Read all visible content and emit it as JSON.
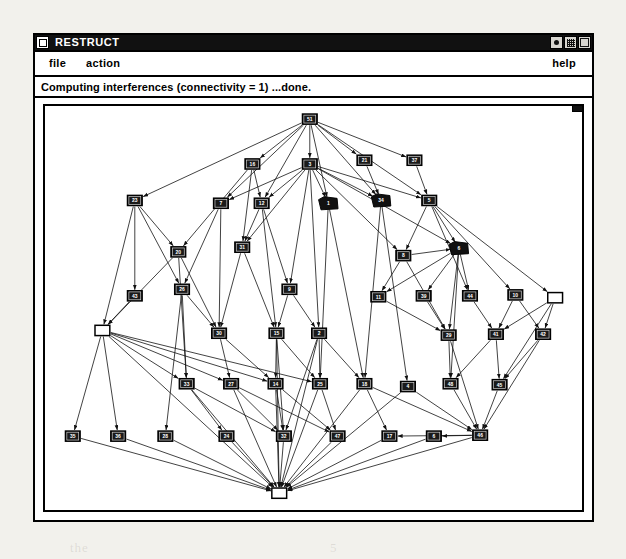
{
  "window": {
    "title": "RESTRUCT",
    "menu_button_icon": "window-menu-icon",
    "controls": [
      {
        "name": "minimize-button",
        "icon": "dot-icon"
      },
      {
        "name": "maximize-button",
        "icon": "grid-icon"
      },
      {
        "name": "close-button",
        "icon": "square-icon"
      }
    ]
  },
  "menu_bar": {
    "items": [
      {
        "label": "file",
        "name": "menu-item-file"
      },
      {
        "label": "action",
        "name": "menu-item-action"
      }
    ],
    "help_label": "help"
  },
  "status_bar": {
    "text": "Computing interferences (connectivity = 1) ...done."
  },
  "graph": {
    "type": "directed-acyclic-graph",
    "node_count": 52,
    "colors": {
      "node_fill_default": "#111111",
      "node_fill_highlight": "#ffffff",
      "node_stroke": "#000000",
      "edge": "#111111",
      "canvas": "#ffffff"
    },
    "legend": {
      "filled_black_box": "standard node",
      "solid_black_blob": "collapsed / selected node",
      "hollow_white_box": "root or sink node"
    },
    "nodes": [
      {
        "id": "51",
        "label": "51",
        "x": 286,
        "y": 14,
        "style": "box"
      },
      {
        "id": "16",
        "label": "16",
        "x": 224,
        "y": 62,
        "style": "box"
      },
      {
        "id": "3",
        "label": "3",
        "x": 286,
        "y": 62,
        "style": "box"
      },
      {
        "id": "21",
        "label": "21",
        "x": 345,
        "y": 58,
        "style": "box"
      },
      {
        "id": "37",
        "label": "37",
        "x": 399,
        "y": 58,
        "style": "box"
      },
      {
        "id": "23",
        "label": "23",
        "x": 97,
        "y": 101,
        "style": "box"
      },
      {
        "id": "7",
        "label": "7",
        "x": 190,
        "y": 104,
        "style": "box"
      },
      {
        "id": "12",
        "label": "12",
        "x": 234,
        "y": 104,
        "style": "box"
      },
      {
        "id": "1",
        "label": "1",
        "x": 306,
        "y": 104,
        "style": "blob"
      },
      {
        "id": "34",
        "label": "34",
        "x": 363,
        "y": 101,
        "style": "blob"
      },
      {
        "id": "5",
        "label": "5",
        "x": 415,
        "y": 101,
        "style": "box"
      },
      {
        "id": "20",
        "label": "20",
        "x": 144,
        "y": 156,
        "style": "box"
      },
      {
        "id": "31",
        "label": "31",
        "x": 213,
        "y": 151,
        "style": "box"
      },
      {
        "id": "6",
        "label": "6",
        "x": 447,
        "y": 152,
        "style": "blob"
      },
      {
        "id": "8",
        "label": "8",
        "x": 387,
        "y": 160,
        "style": "box"
      },
      {
        "id": "43",
        "label": "43",
        "x": 97,
        "y": 203,
        "style": "box"
      },
      {
        "id": "26",
        "label": "26",
        "x": 148,
        "y": 196,
        "style": "box"
      },
      {
        "id": "9",
        "label": "9",
        "x": 264,
        "y": 196,
        "style": "box"
      },
      {
        "id": "11",
        "label": "11",
        "x": 360,
        "y": 204,
        "style": "box"
      },
      {
        "id": "39",
        "label": "39",
        "x": 409,
        "y": 203,
        "style": "box"
      },
      {
        "id": "44",
        "label": "44",
        "x": 459,
        "y": 203,
        "style": "box"
      },
      {
        "id": "10",
        "label": "10",
        "x": 508,
        "y": 202,
        "style": "box"
      },
      {
        "id": "R1",
        "label": "",
        "x": 551,
        "y": 205,
        "style": "hollow"
      },
      {
        "id": "L1",
        "label": "",
        "x": 62,
        "y": 240,
        "style": "hollow"
      },
      {
        "id": "30",
        "label": "30",
        "x": 188,
        "y": 243,
        "style": "box"
      },
      {
        "id": "15",
        "label": "15",
        "x": 250,
        "y": 243,
        "style": "box"
      },
      {
        "id": "2",
        "label": "2",
        "x": 296,
        "y": 243,
        "style": "box"
      },
      {
        "id": "29",
        "label": "29",
        "x": 436,
        "y": 245,
        "style": "box"
      },
      {
        "id": "41",
        "label": "41",
        "x": 487,
        "y": 244,
        "style": "box"
      },
      {
        "id": "42",
        "label": "42",
        "x": 538,
        "y": 244,
        "style": "box"
      },
      {
        "id": "33",
        "label": "33",
        "x": 153,
        "y": 297,
        "style": "box"
      },
      {
        "id": "27",
        "label": "27",
        "x": 201,
        "y": 297,
        "style": "box"
      },
      {
        "id": "14",
        "label": "14",
        "x": 249,
        "y": 297,
        "style": "box"
      },
      {
        "id": "25",
        "label": "25",
        "x": 297,
        "y": 297,
        "style": "box"
      },
      {
        "id": "18",
        "label": "18",
        "x": 345,
        "y": 297,
        "style": "box"
      },
      {
        "id": "4",
        "label": "4",
        "x": 392,
        "y": 300,
        "style": "box"
      },
      {
        "id": "48",
        "label": "48",
        "x": 438,
        "y": 297,
        "style": "box"
      },
      {
        "id": "45",
        "label": "45",
        "x": 491,
        "y": 298,
        "style": "box"
      },
      {
        "id": "35",
        "label": "35",
        "x": 30,
        "y": 353,
        "style": "box"
      },
      {
        "id": "36",
        "label": "36",
        "x": 79,
        "y": 353,
        "style": "box"
      },
      {
        "id": "28",
        "label": "28",
        "x": 130,
        "y": 353,
        "style": "box"
      },
      {
        "id": "24",
        "label": "24",
        "x": 196,
        "y": 353,
        "style": "box"
      },
      {
        "id": "32",
        "label": "32",
        "x": 258,
        "y": 353,
        "style": "box"
      },
      {
        "id": "47",
        "label": "47",
        "x": 316,
        "y": 353,
        "style": "box"
      },
      {
        "id": "17",
        "label": "17",
        "x": 372,
        "y": 353,
        "style": "box"
      },
      {
        "id": "6b",
        "label": "6",
        "x": 420,
        "y": 353,
        "style": "box"
      },
      {
        "id": "46",
        "label": "46",
        "x": 470,
        "y": 352,
        "style": "box"
      },
      {
        "id": "S1",
        "label": "",
        "x": 253,
        "y": 414,
        "style": "hollow"
      }
    ],
    "edges": [
      [
        "51",
        "23"
      ],
      [
        "51",
        "16"
      ],
      [
        "51",
        "3"
      ],
      [
        "51",
        "21"
      ],
      [
        "51",
        "37"
      ],
      [
        "51",
        "7"
      ],
      [
        "51",
        "12"
      ],
      [
        "51",
        "1"
      ],
      [
        "51",
        "34"
      ],
      [
        "51",
        "5"
      ],
      [
        "3",
        "7"
      ],
      [
        "3",
        "12"
      ],
      [
        "3",
        "1"
      ],
      [
        "3",
        "34"
      ],
      [
        "3",
        "5"
      ],
      [
        "3",
        "31"
      ],
      [
        "3",
        "9"
      ],
      [
        "3",
        "2"
      ],
      [
        "3",
        "8"
      ],
      [
        "3",
        "6"
      ],
      [
        "16",
        "20"
      ],
      [
        "16",
        "12"
      ],
      [
        "16",
        "31"
      ],
      [
        "21",
        "34"
      ],
      [
        "37",
        "5"
      ],
      [
        "5",
        "8"
      ],
      [
        "5",
        "6"
      ],
      [
        "5",
        "44"
      ],
      [
        "5",
        "10"
      ],
      [
        "5",
        "R1"
      ],
      [
        "23",
        "43"
      ],
      [
        "23",
        "26"
      ],
      [
        "23",
        "L1"
      ],
      [
        "23",
        "20"
      ],
      [
        "7",
        "26"
      ],
      [
        "7",
        "30"
      ],
      [
        "12",
        "31"
      ],
      [
        "12",
        "15"
      ],
      [
        "12",
        "9"
      ],
      [
        "20",
        "30"
      ],
      [
        "20",
        "33"
      ],
      [
        "20",
        "L1"
      ],
      [
        "31",
        "15"
      ],
      [
        "31",
        "30"
      ],
      [
        "9",
        "2"
      ],
      [
        "9",
        "15"
      ],
      [
        "1",
        "25"
      ],
      [
        "1",
        "18"
      ],
      [
        "34",
        "18"
      ],
      [
        "34",
        "4"
      ],
      [
        "8",
        "11"
      ],
      [
        "8",
        "29"
      ],
      [
        "8",
        "6"
      ],
      [
        "6",
        "11"
      ],
      [
        "6",
        "39"
      ],
      [
        "6",
        "44"
      ],
      [
        "6",
        "29"
      ],
      [
        "6",
        "48"
      ],
      [
        "43",
        "L1"
      ],
      [
        "26",
        "30"
      ],
      [
        "26",
        "33"
      ],
      [
        "26",
        "28"
      ],
      [
        "L1",
        "33"
      ],
      [
        "L1",
        "27"
      ],
      [
        "L1",
        "35"
      ],
      [
        "L1",
        "36"
      ],
      [
        "L1",
        "14"
      ],
      [
        "L1",
        "25"
      ],
      [
        "30",
        "27"
      ],
      [
        "30",
        "14"
      ],
      [
        "15",
        "14"
      ],
      [
        "15",
        "25"
      ],
      [
        "15",
        "32"
      ],
      [
        "2",
        "25"
      ],
      [
        "2",
        "18"
      ],
      [
        "2",
        "32"
      ],
      [
        "11",
        "29"
      ],
      [
        "39",
        "29"
      ],
      [
        "44",
        "41"
      ],
      [
        "10",
        "42"
      ],
      [
        "10",
        "41"
      ],
      [
        "R1",
        "42"
      ],
      [
        "R1",
        "41"
      ],
      [
        "R1",
        "45"
      ],
      [
        "29",
        "48"
      ],
      [
        "29",
        "46"
      ],
      [
        "41",
        "45"
      ],
      [
        "41",
        "48"
      ],
      [
        "42",
        "45"
      ],
      [
        "42",
        "46"
      ],
      [
        "33",
        "24"
      ],
      [
        "33",
        "32"
      ],
      [
        "27",
        "32"
      ],
      [
        "27",
        "47"
      ],
      [
        "14",
        "32"
      ],
      [
        "14",
        "47"
      ],
      [
        "25",
        "47"
      ],
      [
        "18",
        "17"
      ],
      [
        "18",
        "46"
      ],
      [
        "4",
        "46"
      ],
      [
        "48",
        "46"
      ],
      [
        "45",
        "46"
      ],
      [
        "35",
        "S1"
      ],
      [
        "36",
        "S1"
      ],
      [
        "28",
        "S1"
      ],
      [
        "24",
        "S1"
      ],
      [
        "32",
        "S1"
      ],
      [
        "47",
        "S1"
      ],
      [
        "17",
        "S1"
      ],
      [
        "6b",
        "S1"
      ],
      [
        "46",
        "S1"
      ],
      [
        "33",
        "S1"
      ],
      [
        "27",
        "S1"
      ],
      [
        "14",
        "S1"
      ],
      [
        "25",
        "S1"
      ],
      [
        "18",
        "S1"
      ],
      [
        "4",
        "S1"
      ],
      [
        "2",
        "S1"
      ],
      [
        "15",
        "S1"
      ],
      [
        "L1",
        "S1"
      ],
      [
        "46",
        "17"
      ],
      [
        "46",
        "6b"
      ]
    ]
  },
  "bleed_text": [
    {
      "t": "a",
      "x": 48,
      "y": 122
    },
    {
      "t": "h",
      "x": 186,
      "y": 112
    },
    {
      "t": "43",
      "x": 433,
      "y": 117
    },
    {
      "t": "21",
      "x": 500,
      "y": 128
    },
    {
      "t": "n",
      "x": 74,
      "y": 196
    },
    {
      "t": "c",
      "x": 463,
      "y": 187
    },
    {
      "t": "51",
      "x": 519,
      "y": 178
    },
    {
      "t": "b",
      "x": 473,
      "y": 215
    },
    {
      "t": "3",
      "x": 62,
      "y": 300
    },
    {
      "t": "a",
      "x": 212,
      "y": 310
    },
    {
      "t": "fonthe",
      "x": 420,
      "y": 345
    },
    {
      "t": "21",
      "x": 52,
      "y": 390
    },
    {
      "t": "2",
      "x": 450,
      "y": 400
    },
    {
      "t": "3",
      "x": 170,
      "y": 470
    },
    {
      "t": "11",
      "x": 493,
      "y": 462
    },
    {
      "t": "the",
      "x": 70,
      "y": 540
    },
    {
      "t": "5",
      "x": 330,
      "y": 540
    }
  ]
}
